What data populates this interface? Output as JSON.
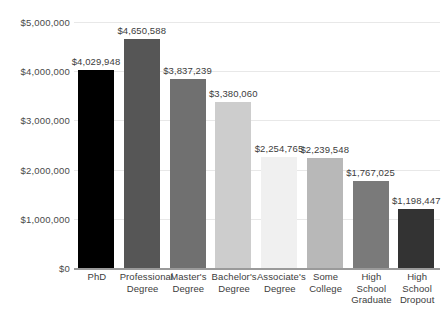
{
  "chart_data": {
    "type": "bar",
    "title": "",
    "subtitle": "",
    "xlabel": "",
    "ylabel": "",
    "ylim": [
      0,
      5000000
    ],
    "grid": true,
    "legend": false,
    "y_ticks": [
      {
        "value": 0,
        "label": "$0"
      },
      {
        "value": 1000000,
        "label": "$1,000,000"
      },
      {
        "value": 2000000,
        "label": "$2,000,000"
      },
      {
        "value": 3000000,
        "label": "$3,000,000"
      },
      {
        "value": 4000000,
        "label": "$4,000,000"
      },
      {
        "value": 5000000,
        "label": "$5,000,000"
      }
    ],
    "categories": [
      "PhD",
      "Professional Degree",
      "Master's Degree",
      "Bachelor's Degree",
      "Associate's Degree",
      "Some College",
      "High School Graduate",
      "High School Dropout"
    ],
    "category_lines": [
      [
        "PhD"
      ],
      [
        "Professional",
        "Degree"
      ],
      [
        "Master's",
        "Degree"
      ],
      [
        "Bachelor's",
        "Degree"
      ],
      [
        "Associate's",
        "Degree"
      ],
      [
        "Some",
        "College"
      ],
      [
        "High",
        "School",
        "Graduate"
      ],
      [
        "High",
        "School",
        "Dropout"
      ]
    ],
    "values": [
      4029948,
      4650588,
      3837239,
      3380060,
      2254765,
      2239548,
      1767025,
      1198447
    ],
    "value_labels": [
      "$4,029,948",
      "$4,650,588",
      "$3,837,239",
      "$3,380,060",
      "$2,254,765",
      "$2,239,548",
      "$1,767,025",
      "$1,198,447"
    ],
    "bar_colors": [
      "#000000",
      "#565656",
      "#707070",
      "#cdcdcd",
      "#f0f0f0",
      "#b8b8b8",
      "#7a7a7a",
      "#333333"
    ],
    "colors": {
      "background": "#ffffff",
      "gridline": "#e8e8e8",
      "axis": "#9a9a9a",
      "tick_text": "#4a4a4a",
      "label_text": "#3c3c3c"
    }
  }
}
